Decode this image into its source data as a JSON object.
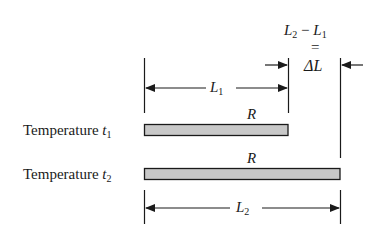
{
  "diagram": {
    "rod_label": "R",
    "rows": [
      {
        "label": "Temperature",
        "symbol": "t",
        "subscript": "1",
        "length_symbol": "L",
        "length_subscript": "1"
      },
      {
        "label": "Temperature",
        "symbol": "t",
        "subscript": "2",
        "length_symbol": "L",
        "length_subscript": "2"
      }
    ],
    "delta": {
      "expr_left": "L",
      "expr_left_sub": "2",
      "minus": "−",
      "expr_right": "L",
      "expr_right_sub": "1",
      "equals": "=",
      "result": "ΔL"
    },
    "colors": {
      "bar_fill": "#c8c8c8",
      "stroke": "#1a1a1a"
    }
  }
}
